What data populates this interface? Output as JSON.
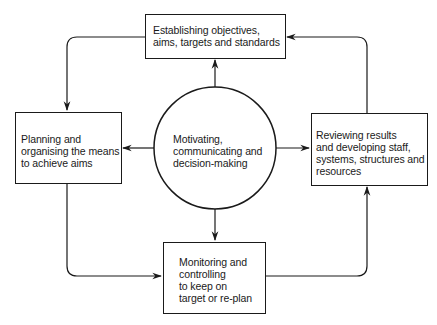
{
  "diagram": {
    "type": "cycle",
    "center": {
      "id": "motivating",
      "label": "Motivating,\ncommunicating and\ndecision-making"
    },
    "nodes": [
      {
        "id": "objectives",
        "label": "Establishing objectives,\naims, targets and standards",
        "position": "top"
      },
      {
        "id": "planning",
        "label": "Planning and\norganising the means\nto achieve aims",
        "position": "left"
      },
      {
        "id": "monitoring",
        "label": "Monitoring and\ncontrolling\nto keep on\ntarget or re-plan",
        "position": "bottom"
      },
      {
        "id": "reviewing",
        "label": "Reviewing results\nand developing staff,\nsystems, structures and\nresources",
        "position": "right"
      }
    ],
    "edges": [
      {
        "from": "motivating",
        "to": "objectives"
      },
      {
        "from": "motivating",
        "to": "planning"
      },
      {
        "from": "motivating",
        "to": "monitoring"
      },
      {
        "from": "motivating",
        "to": "reviewing"
      },
      {
        "from": "objectives",
        "to": "planning"
      },
      {
        "from": "planning",
        "to": "monitoring"
      },
      {
        "from": "monitoring",
        "to": "reviewing"
      },
      {
        "from": "reviewing",
        "to": "objectives"
      }
    ],
    "colors": {
      "line": "#1a1a1a",
      "background": "#ffffff"
    }
  }
}
